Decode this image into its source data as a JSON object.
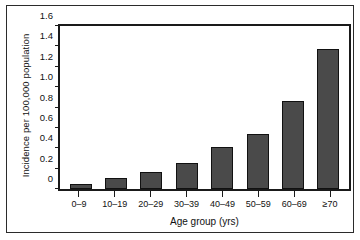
{
  "chart_data": {
    "type": "bar",
    "title": "",
    "xlabel": "Age group (yrs)",
    "ylabel": "Incidence per 100,000 population",
    "categories": [
      "0–9",
      "10–19",
      "20–29",
      "30–39",
      "40–49",
      "50–59",
      "60–69",
      "≥70"
    ],
    "values": [
      0.05,
      0.11,
      0.17,
      0.26,
      0.41,
      0.54,
      0.86,
      1.37
    ],
    "ylim": [
      0,
      1.6
    ],
    "yticks": [
      0,
      0.2,
      0.4,
      0.6,
      0.8,
      1.0,
      1.2,
      1.4,
      1.6
    ],
    "ytick_labels": [
      "0",
      "0.2",
      "0.4",
      "0.6",
      "0.8",
      "1.0",
      "1.2",
      "1.4",
      "1.6"
    ],
    "grid": false,
    "legend": null,
    "bar_color": "#4a4a4a",
    "bar_edge_color": "#111111",
    "axis_color": "#1a1a1a",
    "background": "#ffffff"
  }
}
